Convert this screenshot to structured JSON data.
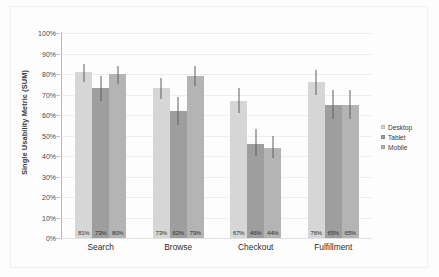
{
  "chart_data": {
    "type": "bar",
    "title": "",
    "subtitle": "",
    "xlabel": "",
    "ylabel": "Single Usability Metric (SUM)",
    "categories": [
      "Search",
      "Browse",
      "Checkout",
      "Fulfillment"
    ],
    "series": [
      {
        "name": "Desktop",
        "color": "#d6d6d6",
        "values": [
          81,
          73,
          67,
          76
        ],
        "labels": [
          "81%",
          "73%",
          "67%",
          "76%"
        ],
        "error_low": [
          76,
          68,
          61,
          70
        ],
        "error_high": [
          85,
          78,
          73,
          82
        ]
      },
      {
        "name": "Tablet",
        "color": "#9e9e9e",
        "values": [
          73,
          62,
          46,
          65
        ],
        "labels": [
          "73%",
          "62%",
          "46%",
          "65%"
        ],
        "error_low": [
          67,
          55,
          40,
          58
        ],
        "error_high": [
          79,
          69,
          53,
          72
        ]
      },
      {
        "name": "Mobile",
        "color": "#b4b4b4",
        "values": [
          80,
          79,
          44,
          65
        ],
        "labels": [
          "80%",
          "79%",
          "44%",
          "65%"
        ],
        "error_low": [
          75,
          74,
          39,
          58
        ],
        "error_high": [
          84,
          84,
          50,
          72
        ]
      }
    ],
    "ylim": [
      0,
      100
    ],
    "ytick_values": [
      0,
      10,
      20,
      30,
      40,
      50,
      60,
      70,
      80,
      90,
      100
    ],
    "ytick_labels": [
      "0%",
      "10%",
      "20%",
      "30%",
      "40%",
      "50%",
      "60%",
      "70%",
      "80%",
      "90%",
      "100%"
    ],
    "grid": true,
    "legend_position": "right",
    "legend_entries": [
      "Desktop",
      "Tablet",
      "Mobile"
    ],
    "error_bars": true,
    "data_labels_shown": true
  }
}
